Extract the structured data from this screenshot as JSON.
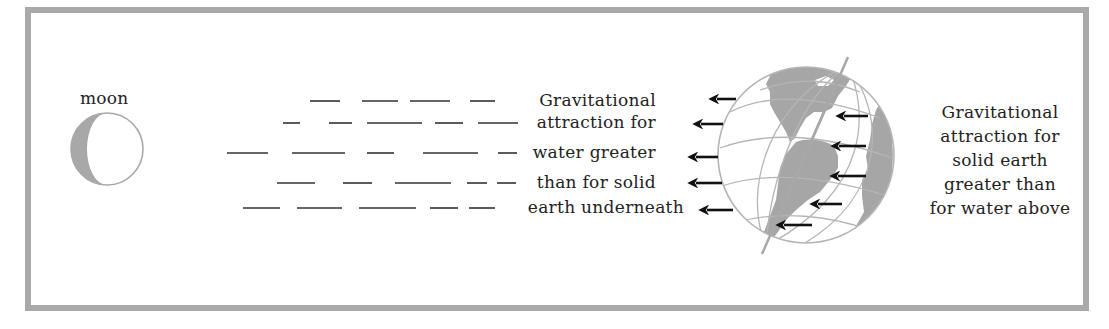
{
  "diagram": {
    "frame": {
      "border_color": "#a9a9a9",
      "background": "#ffffff"
    },
    "moon": {
      "label": "moon",
      "fill_dark": "#a8a8a8",
      "outline": "#a8a8a8",
      "center": [
        107,
        149
      ],
      "radius": 36
    },
    "water_dashes": {
      "color": "#333333",
      "rows": [
        {
          "y": 101,
          "segments": [
            [
              310,
              340
            ],
            [
              362,
              398
            ],
            [
              410,
              450
            ],
            [
              470,
              495
            ]
          ]
        },
        {
          "y": 123,
          "segments": [
            [
              283,
              300
            ],
            [
              329,
              352
            ],
            [
              367,
              422
            ],
            [
              435,
              463
            ],
            [
              478,
              518
            ]
          ]
        },
        {
          "y": 153,
          "segments": [
            [
              227,
              268
            ],
            [
              292,
              345
            ],
            [
              367,
              394
            ],
            [
              423,
              478
            ],
            [
              498,
              517
            ]
          ]
        },
        {
          "y": 183,
          "segments": [
            [
              277,
              315
            ],
            [
              343,
              372
            ],
            [
              395,
              451
            ],
            [
              467,
              487
            ],
            [
              497,
              516
            ]
          ]
        },
        {
          "y": 208,
          "segments": [
            [
              243,
              280
            ],
            [
              297,
              342
            ],
            [
              359,
              416
            ],
            [
              430,
              458
            ],
            [
              469,
              495
            ]
          ]
        }
      ]
    },
    "water_caption": {
      "lines": [
        "Gravitational",
        "attraction for",
        "water greater",
        "than for solid",
        "earth underneath"
      ]
    },
    "earth": {
      "center": [
        806,
        155
      ],
      "radius": 88,
      "land_color": "#a6a6a6",
      "grid_color": "#b5b5b5",
      "axis_top": [
        848,
        57
      ],
      "axis_bottom": [
        762,
        254
      ]
    },
    "arrows": {
      "color": "#111111",
      "water_side": [
        {
          "from": [
            736,
            99
          ],
          "to": [
            711,
            99
          ]
        },
        {
          "from": [
            723,
            124
          ],
          "to": [
            695,
            124
          ]
        },
        {
          "from": [
            718,
            157
          ],
          "to": [
            690,
            157
          ]
        },
        {
          "from": [
            722,
            183
          ],
          "to": [
            690,
            183
          ]
        },
        {
          "from": [
            733,
            210
          ],
          "to": [
            701,
            210
          ]
        }
      ],
      "solid_earth": [
        {
          "from": [
            868,
            116
          ],
          "to": [
            838,
            116
          ]
        },
        {
          "from": [
            866,
            146
          ],
          "to": [
            833,
            146
          ]
        },
        {
          "from": [
            866,
            176
          ],
          "to": [
            832,
            176
          ]
        },
        {
          "from": [
            842,
            204
          ],
          "to": [
            812,
            204
          ]
        },
        {
          "from": [
            812,
            225
          ],
          "to": [
            778,
            225
          ]
        }
      ]
    },
    "earth_caption": {
      "lines": [
        "Gravitational",
        "attraction for",
        "solid earth",
        "greater than",
        "for water above"
      ]
    }
  }
}
